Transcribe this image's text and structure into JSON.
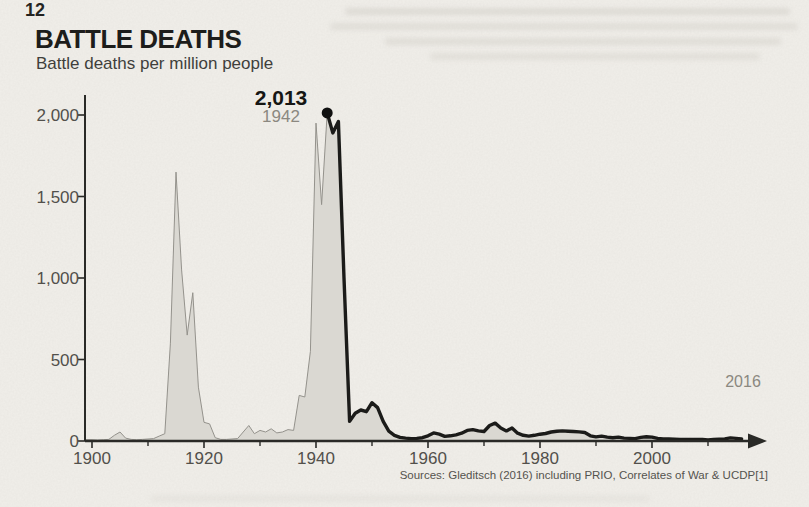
{
  "page": {
    "background": "#f1efea"
  },
  "header": {
    "title": "BATTLE DEATHS",
    "subtitle": "Battle deaths per million people"
  },
  "annotations": {
    "peak": {
      "value_label": "2,013",
      "year_label": "1942",
      "year": 1942,
      "value": 2013
    },
    "latest": {
      "year_label": "2016",
      "value_label": "12",
      "year": 2016,
      "value": 12
    }
  },
  "source": "Sources: Gleditsch (2016) including PRIO, Correlates of War & UCDP[1]",
  "chart_data": {
    "type": "area",
    "title": "BATTLE DEATHS",
    "subtitle": "Battle deaths per million people",
    "xlabel": "Year",
    "ylabel": "Battle deaths per million people",
    "xlim": [
      1900,
      2020
    ],
    "ylim": [
      0,
      2100
    ],
    "grid": false,
    "x_ticks_labeled": [
      1900,
      1920,
      1940,
      1960,
      1980,
      2000
    ],
    "x_ticks_minor": [
      1910,
      1930,
      1950,
      1970,
      1990,
      2010
    ],
    "y_ticks": [
      0,
      500,
      1000,
      1500,
      2000
    ],
    "colors": {
      "area_fill": "#dad8d2",
      "area_outline": "#94928c",
      "highlight_line": "#1b1b19",
      "axis": "#2a2a27",
      "tick_label": "#52504b"
    },
    "highlight_line_start_year": 1942,
    "peak_marker": {
      "year": 1942,
      "value": 2013
    },
    "end_point": {
      "year": 2016,
      "value": 12
    },
    "series": [
      {
        "name": "Battle deaths per million people",
        "x": [
          1900,
          1901,
          1902,
          1903,
          1904,
          1905,
          1906,
          1907,
          1908,
          1909,
          1910,
          1911,
          1912,
          1913,
          1914,
          1915,
          1916,
          1917,
          1918,
          1919,
          1920,
          1921,
          1922,
          1923,
          1924,
          1925,
          1926,
          1927,
          1928,
          1929,
          1930,
          1931,
          1932,
          1933,
          1934,
          1935,
          1936,
          1937,
          1938,
          1939,
          1940,
          1941,
          1942,
          1943,
          1944,
          1945,
          1946,
          1947,
          1948,
          1949,
          1950,
          1951,
          1952,
          1953,
          1954,
          1955,
          1956,
          1957,
          1958,
          1959,
          1960,
          1961,
          1962,
          1963,
          1964,
          1965,
          1966,
          1967,
          1968,
          1969,
          1970,
          1971,
          1972,
          1973,
          1974,
          1975,
          1976,
          1977,
          1978,
          1979,
          1980,
          1981,
          1982,
          1983,
          1984,
          1985,
          1986,
          1987,
          1988,
          1989,
          1990,
          1991,
          1992,
          1993,
          1994,
          1995,
          1996,
          1997,
          1998,
          1999,
          2000,
          2001,
          2002,
          2003,
          2004,
          2005,
          2006,
          2007,
          2008,
          2009,
          2010,
          2011,
          2012,
          2013,
          2014,
          2015,
          2016
        ],
        "y": [
          8,
          6,
          8,
          10,
          35,
          55,
          18,
          10,
          8,
          10,
          12,
          15,
          30,
          45,
          600,
          1650,
          1050,
          650,
          910,
          330,
          115,
          105,
          20,
          10,
          10,
          12,
          15,
          55,
          95,
          45,
          65,
          55,
          75,
          50,
          55,
          70,
          65,
          280,
          270,
          550,
          1950,
          1450,
          2013,
          1890,
          1960,
          1000,
          120,
          170,
          190,
          180,
          235,
          205,
          120,
          60,
          35,
          22,
          18,
          15,
          16,
          20,
          32,
          50,
          42,
          28,
          32,
          38,
          48,
          65,
          70,
          62,
          58,
          95,
          110,
          80,
          62,
          80,
          48,
          35,
          30,
          35,
          42,
          46,
          55,
          60,
          62,
          60,
          58,
          56,
          52,
          32,
          25,
          30,
          24,
          20,
          24,
          18,
          16,
          15,
          22,
          26,
          24,
          16,
          13,
          13,
          11,
          9,
          9,
          9,
          10,
          9,
          7,
          9,
          11,
          13,
          19,
          16,
          12
        ]
      }
    ]
  }
}
